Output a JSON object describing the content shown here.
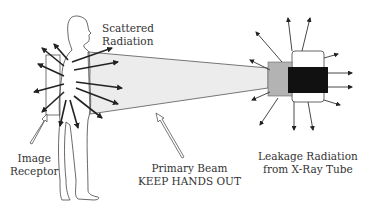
{
  "labels": {
    "scattered": [
      "Scattered",
      "Radiation"
    ],
    "receptor": [
      "Image",
      "Receptor"
    ],
    "primary": [
      "Primary Beam",
      "KEEP HANDS OUT"
    ],
    "leakage": [
      "Leakage Radiation",
      "from X-Ray Tube"
    ]
  },
  "colors": {
    "beam_fill": "#ececec",
    "collimator": "#b3b3b3",
    "tube_core": "#111111",
    "tube_housing": "#ffffff",
    "stroke": "#333333"
  }
}
